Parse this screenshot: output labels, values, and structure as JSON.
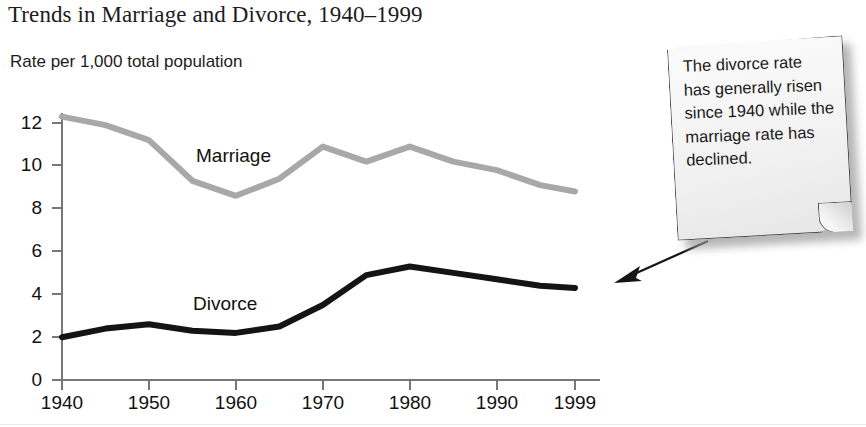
{
  "figure": {
    "title": "Trends in Marriage and Divorce, 1940–1999",
    "subtitle": "Rate per 1,000 total population"
  },
  "callout": {
    "text": "The divorce rate has generally risen since 1940 while the marriage rate has declined.",
    "arrow_name": "callout-arrow-to-chart"
  },
  "colors": {
    "marriage_line": "#a8a8a8",
    "divorce_line": "#141414",
    "axis": "#6f6f6f",
    "text": "#1a1a1a",
    "note_paper": "#f2f2f2",
    "note_border": "#4a4a4a"
  },
  "chart_data": {
    "type": "line",
    "title": "Trends in Marriage and Divorce, 1940–1999",
    "subtitle": "Rate per 1,000 total population",
    "xlabel": "",
    "ylabel": "Rate per 1,000 total population",
    "xlim": [
      1940,
      1999
    ],
    "ylim": [
      0,
      13
    ],
    "yticks": [
      0,
      2,
      4,
      6,
      8,
      10,
      12
    ],
    "xticks": [
      1940,
      1950,
      1960,
      1970,
      1980,
      1990,
      1999
    ],
    "ytick_labels": [
      "0",
      "2",
      "4",
      "6",
      "8",
      "10",
      "12"
    ],
    "xtick_labels": [
      "1940",
      "1950",
      "1960",
      "1970",
      "1980",
      "1990",
      "1999"
    ],
    "grid": false,
    "legend": "inline-labels",
    "series": [
      {
        "name": "Marriage",
        "color": "#a8a8a8",
        "x": [
          1940,
          1945,
          1950,
          1955,
          1960,
          1965,
          1970,
          1975,
          1980,
          1985,
          1990,
          1995,
          1999
        ],
        "values": [
          12.3,
          11.9,
          11.2,
          9.3,
          8.6,
          9.4,
          10.9,
          10.2,
          10.9,
          10.2,
          9.8,
          9.1,
          8.8
        ]
      },
      {
        "name": "Divorce",
        "color": "#141414",
        "x": [
          1940,
          1945,
          1950,
          1955,
          1960,
          1965,
          1970,
          1975,
          1980,
          1985,
          1990,
          1995,
          1999
        ],
        "values": [
          2.0,
          2.4,
          2.6,
          2.3,
          2.2,
          2.5,
          3.5,
          4.9,
          5.3,
          5.0,
          4.7,
          4.4,
          4.3
        ]
      }
    ],
    "annotations": [
      {
        "text": "Marriage",
        "x": 1958,
        "y": 10.4
      },
      {
        "text": "Divorce",
        "x": 1958,
        "y": 3.1
      },
      {
        "text": "The divorce rate has generally risen since 1940 while the marriage rate has declined.",
        "x": 1999,
        "y": 11.5
      }
    ]
  }
}
